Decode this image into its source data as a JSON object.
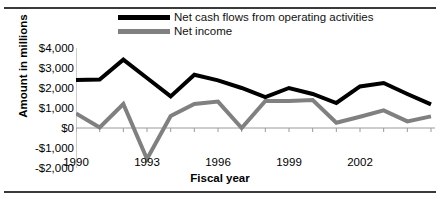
{
  "chart_data": {
    "type": "line",
    "title": "",
    "xlabel": "Fiscal year",
    "ylabel": "Amount  in millions",
    "x": [
      1990,
      1991,
      1992,
      1993,
      1994,
      1995,
      1996,
      1997,
      1998,
      1999,
      2000,
      2001,
      2002,
      2003,
      2004,
      2005
    ],
    "xlim": [
      1990,
      2005
    ],
    "ylim": [
      -2000,
      4000
    ],
    "yticks": [
      4000,
      3000,
      2000,
      1000,
      0,
      -1000,
      -2000
    ],
    "ytick_labels": [
      "$4,000",
      "$3,000",
      "$2,000",
      "$1,000",
      "$0",
      "-$1,000",
      "-$2,000"
    ],
    "xtick_labels": [
      "1990",
      "1993",
      "1996",
      "1999",
      "2002"
    ],
    "xtick_values": [
      1990,
      1993,
      1996,
      1999,
      2002
    ],
    "grid": false,
    "legend_position": "top-center",
    "series": [
      {
        "name": "Net cash flows from operating activities",
        "color": "#000000",
        "values": [
          2400,
          2420,
          3420,
          2500,
          1580,
          2660,
          2380,
          2000,
          1550,
          2000,
          1700,
          1250,
          2080,
          2250,
          1700,
          1180
        ]
      },
      {
        "name": "Net income",
        "color": "#808080",
        "values": [
          730,
          30,
          1200,
          -1550,
          600,
          1200,
          1320,
          0,
          1350,
          1350,
          1400,
          260,
          560,
          880,
          330,
          580
        ]
      }
    ]
  },
  "legend": {
    "items": [
      {
        "label": "Net cash flows from operating activities",
        "color": "#000000"
      },
      {
        "label": "Net income",
        "color": "#808080"
      }
    ]
  },
  "axes": {
    "x_title": "Fiscal year",
    "y_title": "Amount  in millions"
  }
}
